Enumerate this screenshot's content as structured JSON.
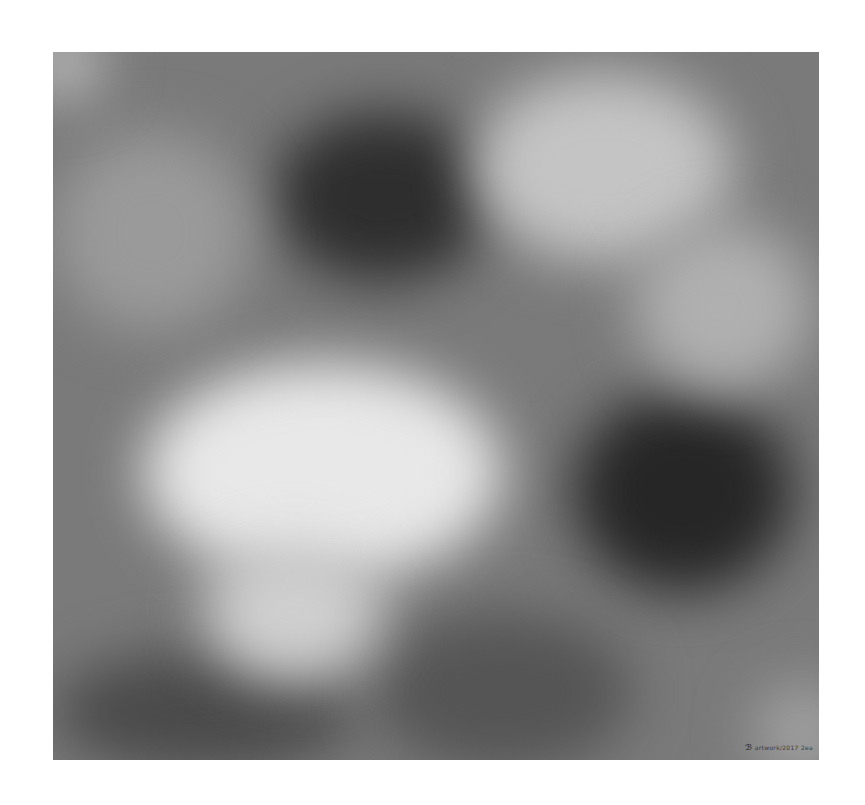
{
  "artwork": {
    "type": "abstract grayscale cloud-like painting",
    "signature_mark": "ℬ",
    "signature_text": "artwork/2017 2ea"
  }
}
